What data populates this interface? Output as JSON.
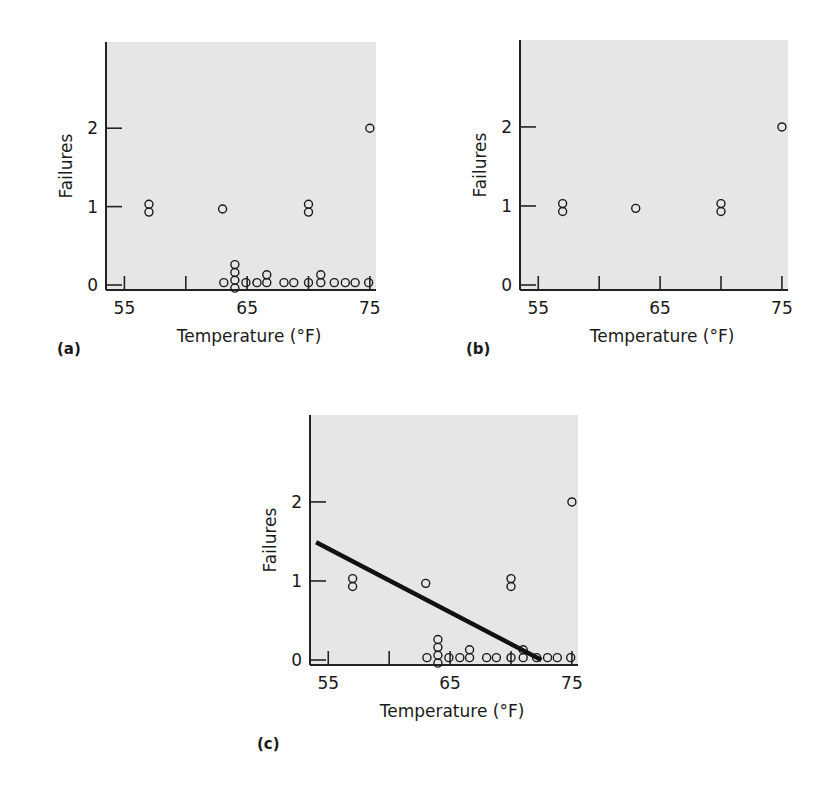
{
  "chart_data": [
    {
      "panel": "(a)",
      "type": "scatter",
      "title": "",
      "xlabel": "Temperature (°F)",
      "ylabel": "Failures",
      "xticks": [
        55,
        65,
        75
      ],
      "yticks": [
        0,
        1,
        2
      ],
      "xlim": [
        53.5,
        75.5
      ],
      "ylim": [
        0,
        3.1
      ],
      "grid": false,
      "points": [
        {
          "x": 57,
          "y": 1.03
        },
        {
          "x": 57,
          "y": 0.93
        },
        {
          "x": 63,
          "y": 0.97
        },
        {
          "x": 70,
          "y": 1.03
        },
        {
          "x": 70,
          "y": 0.93
        },
        {
          "x": 75,
          "y": 2.0
        },
        {
          "x": 63.1,
          "y": 0.03
        },
        {
          "x": 64.0,
          "y": -0.04
        },
        {
          "x": 64.0,
          "y": 0.06
        },
        {
          "x": 64.0,
          "y": 0.16
        },
        {
          "x": 64.0,
          "y": 0.26
        },
        {
          "x": 64.9,
          "y": 0.03
        },
        {
          "x": 65.8,
          "y": 0.03
        },
        {
          "x": 66.6,
          "y": 0.03
        },
        {
          "x": 66.6,
          "y": 0.13
        },
        {
          "x": 68.0,
          "y": 0.03
        },
        {
          "x": 68.8,
          "y": 0.03
        },
        {
          "x": 70.0,
          "y": 0.03
        },
        {
          "x": 71.0,
          "y": 0.03
        },
        {
          "x": 71.0,
          "y": 0.13
        },
        {
          "x": 72.1,
          "y": 0.03
        },
        {
          "x": 73.0,
          "y": 0.03
        },
        {
          "x": 73.8,
          "y": 0.03
        },
        {
          "x": 74.9,
          "y": 0.03
        }
      ]
    },
    {
      "panel": "(b)",
      "type": "scatter",
      "title": "",
      "xlabel": "Temperature (°F)",
      "ylabel": "Failures",
      "xticks": [
        55,
        65,
        75
      ],
      "yticks": [
        0,
        1,
        2
      ],
      "xlim": [
        53.5,
        75.5
      ],
      "ylim": [
        0,
        3.1
      ],
      "grid": false,
      "points": [
        {
          "x": 57,
          "y": 1.03
        },
        {
          "x": 57,
          "y": 0.93
        },
        {
          "x": 63,
          "y": 0.97
        },
        {
          "x": 70,
          "y": 1.03
        },
        {
          "x": 70,
          "y": 0.93
        },
        {
          "x": 75,
          "y": 2.0
        }
      ]
    },
    {
      "panel": "(c)",
      "type": "scatter",
      "title": "",
      "xlabel": "Temperature (°F)",
      "ylabel": "Failures",
      "xticks": [
        55,
        65,
        75
      ],
      "yticks": [
        0,
        1,
        2
      ],
      "xlim": [
        53.5,
        75.5
      ],
      "ylim": [
        0,
        3.1
      ],
      "grid": false,
      "fit_line": {
        "x1": 54,
        "y1": 1.49,
        "x2": 72.5,
        "y2": 0.0
      },
      "points": [
        {
          "x": 57,
          "y": 1.03
        },
        {
          "x": 57,
          "y": 0.93
        },
        {
          "x": 63,
          "y": 0.97
        },
        {
          "x": 70,
          "y": 1.03
        },
        {
          "x": 70,
          "y": 0.93
        },
        {
          "x": 75,
          "y": 2.0
        },
        {
          "x": 63.1,
          "y": 0.03
        },
        {
          "x": 64.0,
          "y": -0.04
        },
        {
          "x": 64.0,
          "y": 0.06
        },
        {
          "x": 64.0,
          "y": 0.16
        },
        {
          "x": 64.0,
          "y": 0.26
        },
        {
          "x": 64.9,
          "y": 0.03
        },
        {
          "x": 65.8,
          "y": 0.03
        },
        {
          "x": 66.6,
          "y": 0.03
        },
        {
          "x": 66.6,
          "y": 0.13
        },
        {
          "x": 68.0,
          "y": 0.03
        },
        {
          "x": 68.8,
          "y": 0.03
        },
        {
          "x": 70.0,
          "y": 0.03
        },
        {
          "x": 71.0,
          "y": 0.03
        },
        {
          "x": 71.0,
          "y": 0.13
        },
        {
          "x": 72.1,
          "y": 0.03
        },
        {
          "x": 73.0,
          "y": 0.03
        },
        {
          "x": 73.8,
          "y": 0.03
        },
        {
          "x": 74.9,
          "y": 0.03
        }
      ]
    }
  ],
  "labels": {
    "a": "(a)",
    "b": "(b)",
    "c": "(c)",
    "xlabel": "Temperature (°F)",
    "ylabel": "Failures",
    "xt0": "55",
    "xt1": "65",
    "xt2": "75",
    "yt0": "0",
    "yt1": "1",
    "yt2": "2"
  }
}
